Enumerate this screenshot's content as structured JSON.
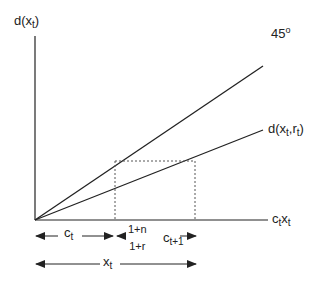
{
  "diagram": {
    "y_axis_label": {
      "base": "d(x",
      "sub": "t",
      "close": ")"
    },
    "x_axis_label": {
      "c": "c",
      "c_sub": "t",
      "x": "x",
      "x_sub": "t"
    },
    "line_45_label": {
      "text": "45",
      "sup": "o"
    },
    "line_d_label": {
      "base": "d(x",
      "sub1": "t",
      "mid": ",r",
      "sub2": "t",
      "close": ")"
    },
    "segment_c_t": {
      "base": "c",
      "sub": "t"
    },
    "fraction": {
      "numerator": "1+n",
      "denominator": "1+r"
    },
    "segment_c_t1": {
      "base": "c",
      "sub": "t+1"
    },
    "segment_x_t": {
      "base": "x",
      "sub": "t"
    },
    "colors": {
      "line": "#222222",
      "dashed": "#555555"
    }
  }
}
